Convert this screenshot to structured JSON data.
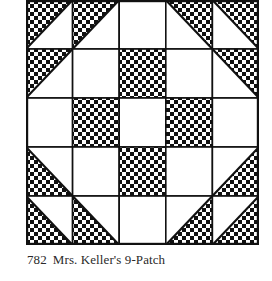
{
  "figure": {
    "number": "782",
    "title": "Mrs. Keller's 9-Patch",
    "caption": "782  Mrs. Keller’s 9-Patch"
  },
  "quilt": {
    "rows": 5,
    "cols": 5,
    "colors": {
      "line": "#111111",
      "background": "#ffffff",
      "dot": "#111111"
    },
    "legend": {
      "W": "plain white square",
      "C": "checkered square",
      "UL": "half-square triangle, checkered upper-left (diagonal bottom-left to top-right)",
      "UR": "half-square triangle, checkered upper-right (diagonal top-left to bottom-right)",
      "LL": "half-square triangle, checkered lower-left (diagonal top-left to bottom-right)",
      "LR": "half-square triangle, checkered lower-right (diagonal bottom-left to top-right)"
    },
    "grid": [
      [
        "UL",
        "UL",
        "W",
        "UR",
        "UR"
      ],
      [
        "UL",
        "W",
        "C",
        "W",
        "UR"
      ],
      [
        "W",
        "C",
        "W",
        "C",
        "W"
      ],
      [
        "LL",
        "W",
        "C",
        "W",
        "LR"
      ],
      [
        "LL",
        "LL",
        "W",
        "LR",
        "LR"
      ]
    ]
  }
}
